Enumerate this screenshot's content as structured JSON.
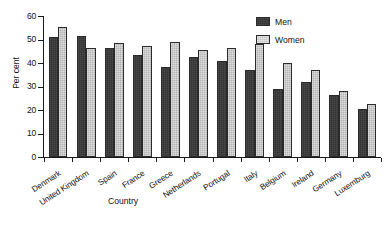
{
  "chart_data": {
    "type": "bar",
    "title": "",
    "xlabel": "Country",
    "ylabel": "Per cent",
    "ylim": [
      0,
      60
    ],
    "yticks": [
      0,
      10,
      20,
      30,
      40,
      50,
      60
    ],
    "ytick_labels": [
      "0",
      "10",
      "20",
      "30",
      "40",
      "50",
      "60"
    ],
    "grid": false,
    "legend_position": "top-right",
    "categories": [
      "Denmark",
      "United Kingdom",
      "Spain",
      "France",
      "Greece",
      "Netherlands",
      "Portugal",
      "Italy",
      "Belgium",
      "Ireland",
      "Germany",
      "Luxemburg"
    ],
    "series": [
      {
        "name": "Men",
        "color": "#333333",
        "values": [
          51,
          51.5,
          46.5,
          43.5,
          38.5,
          42.5,
          41,
          37,
          29,
          32,
          26.5,
          20.5
        ]
      },
      {
        "name": "Women",
        "color": "#b4b4b4",
        "values": [
          55.5,
          46.5,
          48.5,
          47.5,
          49,
          45.5,
          46.5,
          48,
          40,
          37,
          28,
          22.5
        ]
      }
    ]
  },
  "legend": {
    "entries": [
      {
        "label": "Men",
        "key": "men"
      },
      {
        "label": "Women",
        "key": "women"
      }
    ]
  }
}
